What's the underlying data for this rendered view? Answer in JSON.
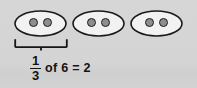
{
  "figure": {
    "background_color": "#d4d4d4",
    "groups": [
      {
        "label": "group-1",
        "dot_count": 2
      },
      {
        "label": "group-2",
        "dot_count": 2
      },
      {
        "label": "group-3",
        "dot_count": 2
      }
    ],
    "bracket": {
      "label": "brace-under-first-group",
      "spans_groups": 1
    },
    "equation": {
      "fraction_numerator": "1",
      "fraction_denominator": "3",
      "rest": "of 6 = 2",
      "full_text": "1/3 of 6 = 2"
    },
    "colors": {
      "ink": "#141414",
      "oval_fill": "#f2f2f2",
      "dot_fill": "#8d8d8d"
    }
  }
}
